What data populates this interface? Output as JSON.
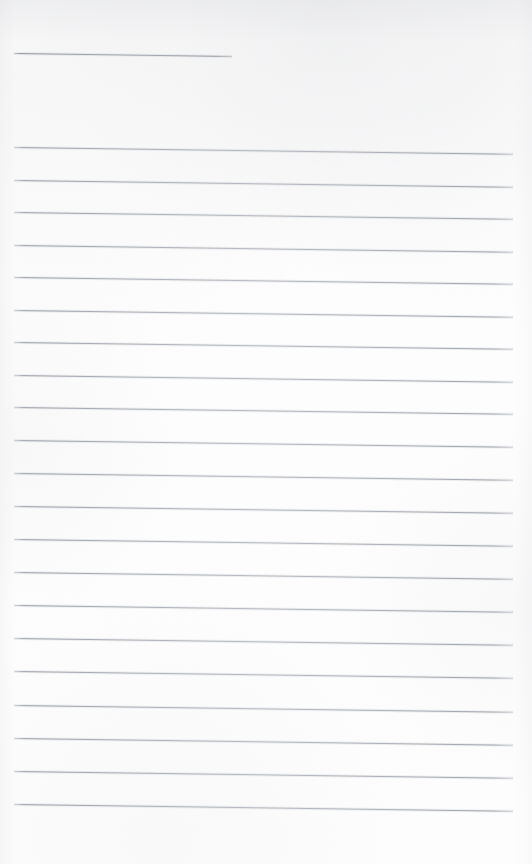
{
  "document": {
    "type": "lined-paper-scan",
    "title": "Blank ruled notepaper page",
    "page_width": 532,
    "page_height": 864,
    "background_color": "#fdfdfd",
    "rule_color": "#9aa0a9",
    "content_text": "",
    "is_blank": true
  },
  "layout": {
    "left_margin": 14,
    "right_edge": 513,
    "line_thickness": 1,
    "line_spacing": 32.6,
    "skew_degrees": 0.78,
    "top_blank_height": 45,
    "bottom_blank_height": 52
  },
  "rules": [
    {
      "id": "rule-header",
      "y": 53,
      "x": 14,
      "width": 218,
      "variant": "short"
    },
    {
      "id": "rule-01",
      "y": 147,
      "x": 14,
      "width": 499,
      "variant": "full"
    },
    {
      "id": "rule-02",
      "y": 180,
      "x": 14,
      "width": 499,
      "variant": "full"
    },
    {
      "id": "rule-03",
      "y": 212,
      "x": 14,
      "width": 499,
      "variant": "full"
    },
    {
      "id": "rule-04",
      "y": 245,
      "x": 14,
      "width": 499,
      "variant": "full"
    },
    {
      "id": "rule-05",
      "y": 277,
      "x": 14,
      "width": 499,
      "variant": "full"
    },
    {
      "id": "rule-06",
      "y": 310,
      "x": 14,
      "width": 499,
      "variant": "full"
    },
    {
      "id": "rule-07",
      "y": 342,
      "x": 14,
      "width": 499,
      "variant": "full"
    },
    {
      "id": "rule-08",
      "y": 375,
      "x": 14,
      "width": 499,
      "variant": "full"
    },
    {
      "id": "rule-09",
      "y": 407,
      "x": 14,
      "width": 499,
      "variant": "full"
    },
    {
      "id": "rule-10",
      "y": 440,
      "x": 14,
      "width": 499,
      "variant": "full"
    },
    {
      "id": "rule-11",
      "y": 473,
      "x": 14,
      "width": 499,
      "variant": "full"
    },
    {
      "id": "rule-12",
      "y": 506,
      "x": 14,
      "width": 499,
      "variant": "full"
    },
    {
      "id": "rule-13",
      "y": 539,
      "x": 14,
      "width": 499,
      "variant": "full"
    },
    {
      "id": "rule-14",
      "y": 572,
      "x": 14,
      "width": 499,
      "variant": "full"
    },
    {
      "id": "rule-15",
      "y": 605,
      "x": 14,
      "width": 499,
      "variant": "full"
    },
    {
      "id": "rule-16",
      "y": 638,
      "x": 14,
      "width": 499,
      "variant": "full"
    },
    {
      "id": "rule-17",
      "y": 671,
      "x": 14,
      "width": 499,
      "variant": "full"
    },
    {
      "id": "rule-18",
      "y": 705,
      "x": 14,
      "width": 499,
      "variant": "full"
    },
    {
      "id": "rule-19",
      "y": 738,
      "x": 14,
      "width": 499,
      "variant": "full"
    },
    {
      "id": "rule-20",
      "y": 771,
      "x": 14,
      "width": 499,
      "variant": "full"
    },
    {
      "id": "rule-21",
      "y": 804,
      "x": 14,
      "width": 499,
      "variant": "full"
    }
  ]
}
